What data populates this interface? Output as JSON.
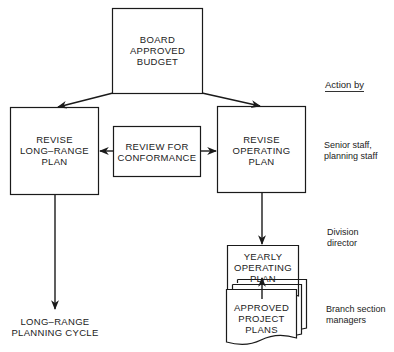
{
  "diagram": {
    "heading": "Action by",
    "nodes": [
      {
        "id": "board",
        "shape": "rectangle",
        "label": "BOARD\nAPPROVED\nBUDGET"
      },
      {
        "id": "long_range",
        "shape": "rectangle",
        "label": "REVISE\nLONG–RANGE\nPLAN"
      },
      {
        "id": "review",
        "shape": "rectangle",
        "label": "REVIEW FOR\nCONFORMANCE"
      },
      {
        "id": "operating",
        "shape": "rectangle",
        "label": "REVISE\nOPERATING\nPLAN"
      },
      {
        "id": "yearly",
        "shape": "document",
        "label": "YEARLY\nOPERATING\nPLAN"
      },
      {
        "id": "approved",
        "shape": "multi-document",
        "label": "APPROVED\nPROJECT\nPLANS"
      },
      {
        "id": "cycle",
        "shape": "terminal-text",
        "label": "LONG–RANGE\nPLANNING CYCLE"
      }
    ],
    "edges": [
      {
        "from": "board",
        "to": "long_range"
      },
      {
        "from": "board",
        "to": "operating"
      },
      {
        "from": "review",
        "to": "long_range"
      },
      {
        "from": "review",
        "to": "operating"
      },
      {
        "from": "operating",
        "to": "yearly"
      },
      {
        "from": "yearly",
        "to": "approved"
      },
      {
        "from": "long_range",
        "to": "cycle"
      }
    ],
    "actors": [
      {
        "level": "revise",
        "label": "Senior staff,\nplanning staff"
      },
      {
        "level": "yearly",
        "label": "Division\ndirector"
      },
      {
        "level": "approved",
        "label": "Branch section\nmanagers"
      }
    ],
    "colors": {
      "stroke": "#1a1a1a",
      "background": "#ffffff"
    }
  }
}
